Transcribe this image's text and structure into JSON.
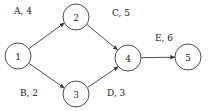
{
  "diagram": {
    "type": "activity-on-arrow-network",
    "width": 210,
    "height": 111,
    "background_color": "#ffffff",
    "stroke_color": "#3a3a3a",
    "text_color": "#1a1a1a",
    "node_radius": 13,
    "nodes": [
      {
        "id": "1",
        "label": "1",
        "cx": 18,
        "cy": 56
      },
      {
        "id": "2",
        "label": "2",
        "cx": 76,
        "cy": 17
      },
      {
        "id": "3",
        "label": "3",
        "cx": 76,
        "cy": 94
      },
      {
        "id": "4",
        "label": "4",
        "cx": 128,
        "cy": 58
      },
      {
        "id": "5",
        "label": "5",
        "cx": 188,
        "cy": 57
      }
    ],
    "edges": [
      {
        "id": "A",
        "label": "A, 4",
        "activity": "A",
        "duration": 4,
        "from": "1",
        "to": "2",
        "x1": 28.8,
        "y1": 48.7,
        "x2": 64.4,
        "y2": 22.9,
        "label_x": 14,
        "label_y": 11
      },
      {
        "id": "C",
        "label": "C, 5",
        "activity": "C",
        "duration": 5,
        "from": "2",
        "to": "4",
        "x1": 86.9,
        "y1": 24.6,
        "x2": 117.7,
        "y2": 49.9,
        "label_x": 112,
        "label_y": 13
      },
      {
        "id": "B",
        "label": "B, 2",
        "activity": "B",
        "duration": 2,
        "from": "1",
        "to": "3",
        "x1": 28.8,
        "y1": 63.3,
        "x2": 64.4,
        "y2": 88.1,
        "label_x": 20,
        "label_y": 93
      },
      {
        "id": "D",
        "label": "D, 3",
        "activity": "D",
        "duration": 3,
        "from": "3",
        "to": "4",
        "x1": 87.9,
        "y1": 87.2,
        "x2": 118.4,
        "y2": 66.6,
        "label_x": 107,
        "label_y": 93
      },
      {
        "id": "E",
        "label": "E, 6",
        "activity": "E",
        "duration": 6,
        "from": "4",
        "to": "5",
        "x1": 141,
        "y1": 57.7,
        "x2": 175,
        "y2": 57.2,
        "label_x": 155,
        "label_y": 38
      }
    ]
  }
}
